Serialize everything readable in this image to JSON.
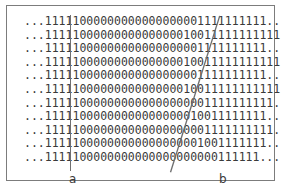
{
  "figure": {
    "background_color": "#ffffff",
    "frame_color": "#7c7c7c",
    "text_color": "#3a3a3a",
    "line_color": "#6f6f6f",
    "rows": [
      "...11111000000000000000001111111111...",
      "...1111100000000000000010011111111111...",
      "...11111000000000000000001111111111...",
      "...1111100000000000000010011111111111...",
      "...11111000000000000000001111111111...",
      "...1111100000000000000010011111111111...",
      "...111110000000000000000001111111111...",
      "...11111000000000000000010011111111...",
      "...111110000000000000000001111111111...",
      "...11111000000000000000001001111111...",
      "...1111100000000000000000000111111..."
    ],
    "row_count": 11,
    "alphabet": [
      "0",
      "1"
    ],
    "ellipsis": "...",
    "markers": {
      "a": {
        "label": "a",
        "kind": "vertical-line",
        "description": "left boundary between the 1-region and the 0-region"
      },
      "b": {
        "label": "b",
        "kind": "slanted-line",
        "description": "right boundary between the 0-region and the 1-region, drifting rightward with depth"
      }
    }
  }
}
